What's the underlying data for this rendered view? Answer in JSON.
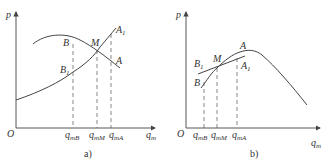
{
  "panels": [
    {
      "caption": "a)",
      "y_axis": "p",
      "x_axis": {
        "base": "q",
        "sub": "m"
      },
      "origin": "O",
      "points": {
        "B": "B",
        "B1": {
          "base": "B",
          "sub": "1"
        },
        "M": "M",
        "A": "A",
        "A1": {
          "base": "A",
          "sub": "1"
        }
      },
      "ticks": [
        {
          "base": "q",
          "sub": "mB"
        },
        {
          "base": "q",
          "sub": "mM"
        },
        {
          "base": "q",
          "sub": "mA"
        }
      ]
    },
    {
      "caption": "b)",
      "y_axis": "p",
      "x_axis": {
        "base": "q",
        "sub": "m"
      },
      "origin": "O",
      "points": {
        "B": "B",
        "B1": {
          "base": "B",
          "sub": "1"
        },
        "M": "M",
        "A": "A",
        "A1": {
          "base": "A",
          "sub": "1"
        }
      },
      "ticks": [
        {
          "base": "q",
          "sub": "mB"
        },
        {
          "base": "q",
          "sub": "mM"
        },
        {
          "base": "q",
          "sub": "mA"
        }
      ]
    }
  ],
  "colors": {
    "line": "#444444",
    "text": "#333333",
    "background": "#ffffff"
  }
}
